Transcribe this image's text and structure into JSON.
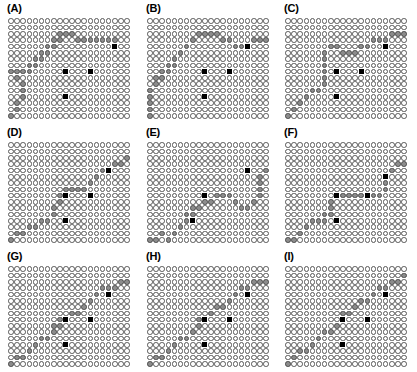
{
  "figure": {
    "type": "panel-grid-figure",
    "rows": 3,
    "cols": 3,
    "width": 417,
    "height": 372,
    "colors": {
      "empty_fill": "#ffffff",
      "empty_stroke": "#585858",
      "path_fill": "#8c8c8c",
      "marker_fill": "#000000",
      "background": "#ffffff"
    }
  },
  "chart_data": {
    "type": "heatmap",
    "title": "",
    "xlabel": "",
    "ylabel": "",
    "grid_cols": 20,
    "grid_rows": 16,
    "legend": [],
    "cell_states": [
      "empty",
      "path",
      "marker"
    ],
    "note": "Nine panels (A)-(I); each panel is a 20x16 lattice of circles. Gray-filled circles trace a monotone warping path from lower-left to upper-right; black squares mark anchor points.",
    "panels": [
      {
        "label": "(A)",
        "row": 0,
        "col": 0,
        "path": [
          [
            0,
            15
          ],
          [
            1,
            14
          ],
          [
            1,
            13
          ],
          [
            2,
            12
          ],
          [
            2,
            11
          ],
          [
            2,
            10
          ],
          [
            1,
            9
          ],
          [
            0,
            8
          ],
          [
            1,
            8
          ],
          [
            2,
            8
          ],
          [
            3,
            8
          ],
          [
            3,
            7
          ],
          [
            4,
            7
          ],
          [
            4,
            6
          ],
          [
            5,
            6
          ],
          [
            5,
            5
          ],
          [
            6,
            5
          ],
          [
            6,
            4
          ],
          [
            7,
            4
          ],
          [
            7,
            3
          ],
          [
            8,
            3
          ],
          [
            8,
            2
          ],
          [
            9,
            2
          ],
          [
            10,
            2
          ],
          [
            11,
            3
          ],
          [
            12,
            3
          ],
          [
            13,
            3
          ],
          [
            14,
            3
          ],
          [
            15,
            3
          ],
          [
            16,
            3
          ],
          [
            17,
            3
          ]
        ],
        "markers": [
          [
            9,
            8
          ],
          [
            9,
            12
          ],
          [
            13,
            8
          ],
          [
            17,
            4
          ]
        ]
      },
      {
        "label": "(B)",
        "row": 0,
        "col": 1,
        "path": [
          [
            0,
            15
          ],
          [
            0,
            14
          ],
          [
            0,
            13
          ],
          [
            0,
            12
          ],
          [
            0,
            11
          ],
          [
            1,
            10
          ],
          [
            1,
            9
          ],
          [
            2,
            9
          ],
          [
            2,
            8
          ],
          [
            3,
            8
          ],
          [
            3,
            7
          ],
          [
            4,
            7
          ],
          [
            4,
            6
          ],
          [
            5,
            5
          ],
          [
            6,
            4
          ],
          [
            7,
            3
          ],
          [
            8,
            2
          ],
          [
            9,
            2
          ],
          [
            10,
            2
          ],
          [
            11,
            2
          ],
          [
            12,
            3
          ],
          [
            13,
            3
          ],
          [
            14,
            4
          ],
          [
            15,
            4
          ],
          [
            16,
            4
          ],
          [
            17,
            3
          ],
          [
            18,
            3
          ],
          [
            19,
            3
          ]
        ],
        "markers": [
          [
            9,
            8
          ],
          [
            9,
            12
          ],
          [
            13,
            8
          ],
          [
            16,
            4
          ]
        ]
      },
      {
        "label": "(C)",
        "row": 0,
        "col": 2,
        "path": [
          [
            0,
            15
          ],
          [
            1,
            14
          ],
          [
            2,
            13
          ],
          [
            3,
            12
          ],
          [
            4,
            11
          ],
          [
            5,
            11
          ],
          [
            6,
            10
          ],
          [
            6,
            9
          ],
          [
            6,
            8
          ],
          [
            6,
            7
          ],
          [
            6,
            6
          ],
          [
            6,
            5
          ],
          [
            7,
            4
          ],
          [
            8,
            4
          ],
          [
            9,
            5
          ],
          [
            10,
            5
          ],
          [
            11,
            5
          ],
          [
            12,
            4
          ],
          [
            13,
            4
          ],
          [
            14,
            3
          ],
          [
            15,
            3
          ],
          [
            16,
            3
          ],
          [
            17,
            2
          ],
          [
            18,
            2
          ],
          [
            19,
            2
          ]
        ],
        "markers": [
          [
            8,
            8
          ],
          [
            8,
            12
          ],
          [
            12,
            8
          ],
          [
            16,
            4
          ]
        ]
      },
      {
        "label": "(D)",
        "row": 1,
        "col": 0,
        "path": [
          [
            0,
            15
          ],
          [
            1,
            14
          ],
          [
            2,
            14
          ],
          [
            3,
            13
          ],
          [
            4,
            13
          ],
          [
            5,
            12
          ],
          [
            6,
            12
          ],
          [
            7,
            11
          ],
          [
            7,
            10
          ],
          [
            8,
            9
          ],
          [
            8,
            8
          ],
          [
            9,
            8
          ],
          [
            9,
            7
          ],
          [
            10,
            7
          ],
          [
            11,
            7
          ],
          [
            12,
            7
          ],
          [
            13,
            6
          ],
          [
            14,
            5
          ],
          [
            15,
            4
          ],
          [
            16,
            4
          ],
          [
            17,
            3
          ],
          [
            18,
            3
          ],
          [
            19,
            2
          ]
        ],
        "markers": [
          [
            9,
            8
          ],
          [
            9,
            12
          ],
          [
            13,
            8
          ],
          [
            16,
            4
          ]
        ]
      },
      {
        "label": "(E)",
        "row": 1,
        "col": 1,
        "path": [
          [
            0,
            15
          ],
          [
            1,
            15
          ],
          [
            2,
            14
          ],
          [
            3,
            15
          ],
          [
            4,
            14
          ],
          [
            5,
            13
          ],
          [
            6,
            12
          ],
          [
            6,
            11
          ],
          [
            7,
            11
          ],
          [
            7,
            10
          ],
          [
            8,
            10
          ],
          [
            9,
            9
          ],
          [
            10,
            9
          ],
          [
            11,
            8
          ],
          [
            12,
            8
          ],
          [
            13,
            8
          ],
          [
            14,
            9
          ],
          [
            15,
            10
          ],
          [
            16,
            10
          ],
          [
            17,
            9
          ],
          [
            18,
            8
          ],
          [
            18,
            7
          ],
          [
            18,
            6
          ],
          [
            18,
            5
          ],
          [
            19,
            4
          ]
        ],
        "markers": [
          [
            7,
            12
          ],
          [
            9,
            8
          ],
          [
            16,
            4
          ]
        ]
      },
      {
        "label": "(F)",
        "row": 1,
        "col": 2,
        "path": [
          [
            0,
            15
          ],
          [
            1,
            15
          ],
          [
            2,
            14
          ],
          [
            3,
            13
          ],
          [
            4,
            12
          ],
          [
            5,
            12
          ],
          [
            6,
            12
          ],
          [
            6,
            11
          ],
          [
            7,
            11
          ],
          [
            7,
            10
          ],
          [
            7,
            9
          ],
          [
            8,
            8
          ],
          [
            9,
            8
          ],
          [
            10,
            8
          ],
          [
            11,
            8
          ],
          [
            12,
            8
          ],
          [
            13,
            8
          ],
          [
            14,
            8
          ],
          [
            15,
            8
          ],
          [
            16,
            7
          ],
          [
            16,
            6
          ],
          [
            16,
            5
          ],
          [
            17,
            4
          ],
          [
            18,
            3
          ],
          [
            19,
            3
          ]
        ],
        "markers": [
          [
            8,
            8
          ],
          [
            8,
            12
          ],
          [
            13,
            8
          ],
          [
            16,
            5
          ]
        ]
      },
      {
        "label": "(G)",
        "row": 2,
        "col": 0,
        "path": [
          [
            0,
            15
          ],
          [
            1,
            14
          ],
          [
            2,
            14
          ],
          [
            3,
            13
          ],
          [
            4,
            12
          ],
          [
            5,
            11
          ],
          [
            6,
            11
          ],
          [
            7,
            10
          ],
          [
            7,
            9
          ],
          [
            8,
            9
          ],
          [
            8,
            8
          ],
          [
            9,
            8
          ],
          [
            10,
            7
          ],
          [
            11,
            7
          ],
          [
            12,
            6
          ],
          [
            13,
            5
          ],
          [
            14,
            4
          ],
          [
            15,
            3
          ],
          [
            16,
            3
          ],
          [
            17,
            3
          ],
          [
            18,
            2
          ],
          [
            19,
            2
          ]
        ],
        "markers": [
          [
            9,
            8
          ],
          [
            9,
            12
          ],
          [
            13,
            8
          ],
          [
            16,
            4
          ]
        ]
      },
      {
        "label": "(H)",
        "row": 2,
        "col": 1,
        "path": [
          [
            0,
            15
          ],
          [
            1,
            14
          ],
          [
            2,
            14
          ],
          [
            3,
            13
          ],
          [
            4,
            12
          ],
          [
            5,
            11
          ],
          [
            6,
            11
          ],
          [
            7,
            10
          ],
          [
            8,
            9
          ],
          [
            8,
            8
          ],
          [
            9,
            8
          ],
          [
            10,
            7
          ],
          [
            11,
            6
          ],
          [
            12,
            6
          ],
          [
            13,
            5
          ],
          [
            14,
            4
          ],
          [
            15,
            3
          ],
          [
            16,
            3
          ],
          [
            17,
            2
          ],
          [
            18,
            2
          ],
          [
            19,
            2
          ]
        ],
        "markers": [
          [
            9,
            8
          ],
          [
            9,
            12
          ],
          [
            13,
            8
          ],
          [
            16,
            4
          ]
        ]
      },
      {
        "label": "(I)",
        "row": 2,
        "col": 2,
        "path": [
          [
            0,
            15
          ],
          [
            1,
            14
          ],
          [
            2,
            13
          ],
          [
            3,
            13
          ],
          [
            4,
            12
          ],
          [
            5,
            11
          ],
          [
            6,
            10
          ],
          [
            7,
            10
          ],
          [
            8,
            9
          ],
          [
            9,
            8
          ],
          [
            9,
            7
          ],
          [
            10,
            7
          ],
          [
            11,
            6
          ],
          [
            12,
            5
          ],
          [
            13,
            5
          ],
          [
            14,
            4
          ],
          [
            15,
            3
          ],
          [
            16,
            3
          ],
          [
            17,
            2
          ],
          [
            18,
            2
          ],
          [
            19,
            1
          ]
        ],
        "markers": [
          [
            9,
            8
          ],
          [
            9,
            12
          ],
          [
            13,
            8
          ],
          [
            16,
            4
          ]
        ]
      }
    ]
  }
}
